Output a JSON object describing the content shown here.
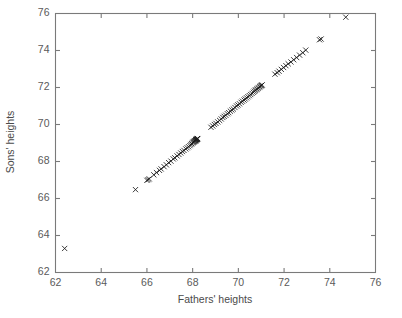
{
  "chart_data": {
    "type": "scatter",
    "title": "",
    "xlabel": "Fathers' heights",
    "ylabel": "Sons' heights",
    "xlim": [
      62,
      76
    ],
    "ylim": [
      62,
      76
    ],
    "xticks": [
      62,
      64,
      66,
      68,
      70,
      72,
      74,
      76
    ],
    "yticks": [
      62,
      64,
      66,
      68,
      70,
      72,
      74,
      76
    ],
    "xticklabels": [
      "62",
      "64",
      "66",
      "68",
      "70",
      "72",
      "74",
      "76"
    ],
    "yticklabels": [
      "62",
      "64",
      "66",
      "68",
      "70",
      "72",
      "74",
      "76"
    ],
    "grid": false,
    "legend": null,
    "marker": "x",
    "marker_color": "#1a1a1a",
    "series": [
      {
        "name": "father-son heights",
        "points": [
          [
            62.4,
            63.3
          ],
          [
            65.5,
            66.48
          ],
          [
            66.0,
            66.98
          ],
          [
            66.05,
            67.02
          ],
          [
            66.1,
            67.06
          ],
          [
            66.3,
            67.28
          ],
          [
            66.42,
            67.4
          ],
          [
            66.55,
            67.52
          ],
          [
            66.62,
            67.6
          ],
          [
            66.75,
            67.72
          ],
          [
            66.85,
            67.82
          ],
          [
            66.95,
            67.94
          ],
          [
            67.05,
            68.02
          ],
          [
            67.15,
            68.14
          ],
          [
            67.22,
            68.2
          ],
          [
            67.32,
            68.3
          ],
          [
            67.4,
            68.38
          ],
          [
            67.48,
            68.46
          ],
          [
            67.55,
            68.54
          ],
          [
            67.62,
            68.6
          ],
          [
            67.7,
            68.68
          ],
          [
            67.76,
            68.74
          ],
          [
            67.82,
            68.8
          ],
          [
            67.88,
            68.86
          ],
          [
            67.92,
            68.92
          ],
          [
            67.96,
            68.96
          ],
          [
            68.0,
            69.0
          ],
          [
            68.02,
            69.04
          ],
          [
            68.05,
            69.06
          ],
          [
            68.07,
            69.08
          ],
          [
            68.09,
            69.1
          ],
          [
            68.1,
            69.12
          ],
          [
            68.12,
            69.13
          ],
          [
            68.13,
            69.15
          ],
          [
            68.14,
            69.16
          ],
          [
            68.15,
            69.17
          ],
          [
            68.16,
            69.18
          ],
          [
            68.17,
            69.19
          ],
          [
            68.18,
            69.2
          ],
          [
            68.19,
            69.21
          ],
          [
            68.2,
            69.22
          ],
          [
            68.21,
            69.23
          ],
          [
            68.22,
            69.24
          ],
          [
            68.8,
            69.85
          ],
          [
            68.88,
            69.92
          ],
          [
            68.95,
            70.0
          ],
          [
            69.02,
            70.06
          ],
          [
            69.1,
            70.14
          ],
          [
            69.18,
            70.22
          ],
          [
            69.25,
            70.3
          ],
          [
            69.32,
            70.38
          ],
          [
            69.38,
            70.44
          ],
          [
            69.45,
            70.5
          ],
          [
            69.52,
            70.58
          ],
          [
            69.58,
            70.64
          ],
          [
            69.65,
            70.72
          ],
          [
            69.72,
            70.78
          ],
          [
            69.78,
            70.84
          ],
          [
            69.85,
            70.92
          ],
          [
            69.92,
            71.0
          ],
          [
            69.98,
            71.06
          ],
          [
            70.05,
            71.12
          ],
          [
            70.12,
            71.2
          ],
          [
            70.18,
            71.26
          ],
          [
            70.25,
            71.32
          ],
          [
            70.3,
            71.38
          ],
          [
            70.36,
            71.44
          ],
          [
            70.42,
            71.5
          ],
          [
            70.48,
            71.56
          ],
          [
            70.54,
            71.62
          ],
          [
            70.6,
            71.68
          ],
          [
            70.66,
            71.74
          ],
          [
            70.7,
            71.8
          ],
          [
            70.74,
            71.84
          ],
          [
            70.78,
            71.88
          ],
          [
            70.82,
            71.92
          ],
          [
            70.86,
            71.96
          ],
          [
            70.9,
            72.0
          ],
          [
            70.94,
            72.04
          ],
          [
            70.97,
            72.08
          ],
          [
            71.0,
            72.1
          ],
          [
            71.02,
            72.12
          ],
          [
            71.04,
            72.14
          ],
          [
            71.6,
            72.72
          ],
          [
            71.7,
            72.8
          ],
          [
            71.78,
            72.88
          ],
          [
            71.88,
            72.98
          ],
          [
            71.98,
            73.08
          ],
          [
            72.08,
            73.18
          ],
          [
            72.18,
            73.28
          ],
          [
            72.3,
            73.38
          ],
          [
            72.42,
            73.5
          ],
          [
            72.55,
            73.62
          ],
          [
            72.68,
            73.75
          ],
          [
            72.82,
            73.88
          ],
          [
            72.95,
            74.02
          ],
          [
            73.55,
            74.58
          ],
          [
            73.62,
            74.62
          ],
          [
            74.7,
            75.8
          ]
        ]
      }
    ]
  },
  "figure": {
    "background_color": "#ffffff",
    "axis_color": "#7a7a7a",
    "text_color": "#4a4a4a"
  }
}
